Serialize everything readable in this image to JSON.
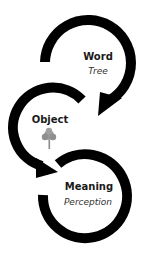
{
  "nodes": [
    {
      "id": "word",
      "title": "Word",
      "subtitle": "Tree"
    },
    {
      "id": "object",
      "title": "Object",
      "icon": "tree-icon"
    },
    {
      "id": "meaning",
      "title": "Meaning",
      "subtitle": "Perception"
    }
  ],
  "edges": [
    {
      "from": "word",
      "to": "object"
    },
    {
      "from": "object",
      "to": "meaning"
    }
  ],
  "colors": {
    "stroke": "#000000",
    "tree": "#8a8a8a",
    "text": "#1a1a1a"
  }
}
